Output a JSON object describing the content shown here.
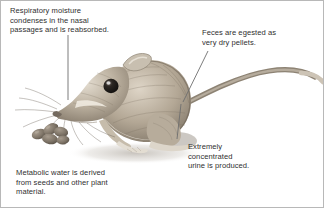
{
  "figure": {
    "background_color": "#ffffff",
    "border_color": "#b8b8b8",
    "text_color": "#2f2f2f",
    "leader_color": "#6e6e6e"
  },
  "callouts": [
    {
      "id": "respiratory",
      "text": "Respiratory moisture\ncondenses in the nasal\npassages and is reabsorbed.",
      "leader": "vertical-line-to-nose"
    },
    {
      "id": "feces",
      "text": "Feces are egested as\nvery dry pellets.",
      "leader": "diagonal-line-to-tail-base"
    },
    {
      "id": "urine",
      "text": "Extremely\nconcentrated\nurine is produced.",
      "leader": "diagonal-line-to-hindquarters"
    },
    {
      "id": "metabolic",
      "text": "Metabolic water is derived\nfrom seeds and other plant\nmaterial.",
      "leader": "none"
    }
  ],
  "illustration": {
    "animal": "kangaroo rat",
    "parts": [
      "head",
      "eye",
      "ear",
      "whiskers",
      "body",
      "forelimb",
      "hind-foot",
      "tail",
      "tail-tuft"
    ],
    "props": [
      "seed-pellets"
    ],
    "fur_light": "#cfc5b6",
    "fur_mid": "#a89b8a",
    "fur_dark": "#6f6559",
    "eye_color": "#2a2522",
    "seed_color": "#7c7266"
  }
}
